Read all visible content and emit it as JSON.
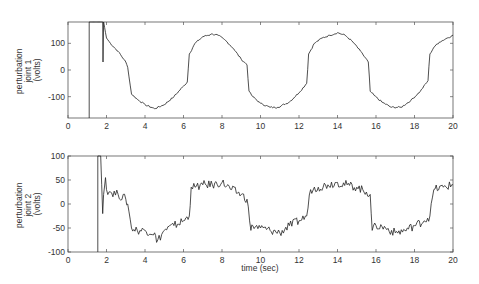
{
  "chart_data": [
    {
      "type": "line",
      "title": "",
      "xlabel": "",
      "ylabel": [
        "perturbation",
        "joint 1",
        "(volts)"
      ],
      "xlim": [
        0,
        20
      ],
      "ylim": [
        -180,
        180
      ],
      "xticks": [
        "0",
        "2",
        "4",
        "6",
        "8",
        "10",
        "12",
        "14",
        "16",
        "18",
        "20"
      ],
      "yticks": [
        "100",
        "0",
        "-100"
      ],
      "grid": false,
      "series": [
        {
          "name": "joint 1",
          "x": [
            1.1,
            1.1,
            1.8,
            1.82,
            1.85,
            1.9,
            2.0,
            2.2,
            2.6,
            3.0,
            3.1,
            3.3,
            3.6,
            4.0,
            4.5,
            5.0,
            5.5,
            6.0,
            6.2,
            6.3,
            6.6,
            7.0,
            7.5,
            7.8,
            8.2,
            8.6,
            9.0,
            9.3,
            9.4,
            9.6,
            10.0,
            10.5,
            10.9,
            11.5,
            12.0,
            12.4,
            12.5,
            12.8,
            13.2,
            13.6,
            14.0,
            14.4,
            14.8,
            15.2,
            15.6,
            15.7,
            15.9,
            16.3,
            16.8,
            17.3,
            17.8,
            18.3,
            18.7,
            18.8,
            19.0,
            19.3,
            19.7,
            20.0
          ],
          "y": [
            -180,
            180,
            180,
            30,
            180,
            160,
            120,
            100,
            70,
            30,
            10,
            -90,
            -110,
            -130,
            -145,
            -130,
            -100,
            -60,
            -45,
            60,
            100,
            125,
            135,
            130,
            110,
            80,
            40,
            20,
            -80,
            -100,
            -125,
            -140,
            -140,
            -120,
            -85,
            -50,
            60,
            100,
            120,
            130,
            140,
            130,
            105,
            70,
            30,
            -80,
            -95,
            -120,
            -140,
            -140,
            -115,
            -80,
            -40,
            60,
            85,
            105,
            120,
            130
          ]
        }
      ]
    },
    {
      "type": "line",
      "title": "",
      "xlabel": "time (sec)",
      "ylabel": [
        "perturbation",
        "joint 2",
        "(volts)"
      ],
      "xlim": [
        0,
        20
      ],
      "ylim": [
        -100,
        100
      ],
      "xticks": [
        "0",
        "2",
        "4",
        "6",
        "8",
        "10",
        "12",
        "14",
        "16",
        "18",
        "20"
      ],
      "yticks": [
        "100",
        "50",
        "0",
        "-50",
        "-100"
      ],
      "grid": false,
      "series": [
        {
          "name": "joint 2",
          "x": [
            1.55,
            1.55,
            1.7,
            1.8,
            1.85,
            1.95,
            2.0,
            2.2,
            2.6,
            3.0,
            3.1,
            3.3,
            3.6,
            4.0,
            4.5,
            4.6,
            5.0,
            5.5,
            6.0,
            6.3,
            6.4,
            6.6,
            7.0,
            7.5,
            8.0,
            8.5,
            9.0,
            9.3,
            9.5,
            9.6,
            10.0,
            10.5,
            11.0,
            11.5,
            12.0,
            12.4,
            12.6,
            13.0,
            13.5,
            14.0,
            14.5,
            15.0,
            15.5,
            15.7,
            15.8,
            16.0,
            16.5,
            17.0,
            17.5,
            18.0,
            18.5,
            18.8,
            19.0,
            19.5,
            20.0
          ],
          "y": [
            -100,
            100,
            100,
            -20,
            20,
            55,
            30,
            25,
            20,
            10,
            0,
            -50,
            -55,
            -55,
            -60,
            -80,
            -55,
            -45,
            -35,
            -25,
            35,
            35,
            40,
            40,
            45,
            30,
            20,
            10,
            -55,
            -45,
            -50,
            -55,
            -60,
            -45,
            -35,
            -25,
            30,
            35,
            40,
            45,
            40,
            35,
            25,
            20,
            -55,
            -45,
            -50,
            -60,
            -55,
            -45,
            -35,
            -25,
            30,
            35,
            40
          ]
        }
      ]
    }
  ],
  "plots": {
    "top": {
      "ylabel_lines": [
        "perturbation",
        "joint 1",
        "(volts)"
      ],
      "yticks": [
        "100",
        "0",
        "-100"
      ],
      "xticks": [
        "0",
        "2",
        "4",
        "6",
        "8",
        "10",
        "12",
        "14",
        "16",
        "18",
        "20"
      ]
    },
    "bottom": {
      "ylabel_lines": [
        "perturbation",
        "joint 2",
        "(volts)"
      ],
      "yticks": [
        "100",
        "50",
        "0",
        "-50",
        "-100"
      ],
      "xticks": [
        "0",
        "2",
        "4",
        "6",
        "8",
        "10",
        "12",
        "14",
        "16",
        "18",
        "20"
      ],
      "xlabel": "time (sec)"
    }
  }
}
